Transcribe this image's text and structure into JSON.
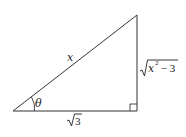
{
  "diagram": {
    "type": "right-triangle",
    "vertices": {
      "angle_vertex": [
        13,
        111
      ],
      "right_angle_vertex": [
        137,
        111
      ],
      "top_vertex": [
        137,
        15
      ]
    },
    "labels": {
      "hypotenuse": "x",
      "opposite_radicand_var": "x",
      "opposite_exponent": "2",
      "opposite_rest": " − 3",
      "adjacent_radicand": "3",
      "angle": "θ"
    },
    "right_angle_marker": true,
    "stroke_color": "#333333"
  }
}
